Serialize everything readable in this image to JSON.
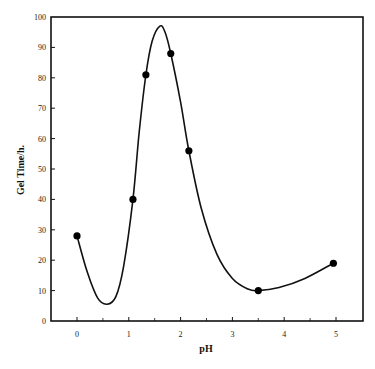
{
  "chart_data": {
    "type": "line",
    "title": "",
    "xlabel": "pH",
    "ylabel": "Gel Time/h.",
    "xlim": [
      -0.5,
      5.6
    ],
    "ylim": [
      0,
      100
    ],
    "x_ticks": [
      0,
      1,
      2,
      3,
      4,
      5
    ],
    "x_tick_labels": [
      "0",
      "1",
      "2",
      "3",
      "4",
      "5"
    ],
    "y_ticks": [
      0,
      10,
      20,
      30,
      40,
      50,
      60,
      70,
      80,
      90,
      100
    ],
    "y_tick_labels": [
      "0",
      "10",
      "20",
      "30",
      "40",
      "50",
      "60",
      "70",
      "80",
      "90",
      "100"
    ],
    "grid": false,
    "legend": null,
    "series": [
      {
        "name": "Gel Time",
        "marker": "filled-circle",
        "points": [
          {
            "x": 0.0,
            "y": 28
          },
          {
            "x": 1.08,
            "y": 40
          },
          {
            "x": 1.33,
            "y": 81
          },
          {
            "x": 1.81,
            "y": 88
          },
          {
            "x": 2.16,
            "y": 56
          },
          {
            "x": 3.5,
            "y": 10
          },
          {
            "x": 4.95,
            "y": 19
          }
        ]
      }
    ],
    "fitted_curve": [
      {
        "x": 0.0,
        "y": 28
      },
      {
        "x": 0.2,
        "y": 16
      },
      {
        "x": 0.4,
        "y": 7.5
      },
      {
        "x": 0.58,
        "y": 5.5
      },
      {
        "x": 0.75,
        "y": 8
      },
      {
        "x": 0.9,
        "y": 18
      },
      {
        "x": 1.08,
        "y": 40
      },
      {
        "x": 1.2,
        "y": 62
      },
      {
        "x": 1.33,
        "y": 81
      },
      {
        "x": 1.45,
        "y": 92
      },
      {
        "x": 1.6,
        "y": 97
      },
      {
        "x": 1.7,
        "y": 95
      },
      {
        "x": 1.81,
        "y": 88
      },
      {
        "x": 2.0,
        "y": 72
      },
      {
        "x": 2.16,
        "y": 56
      },
      {
        "x": 2.4,
        "y": 37
      },
      {
        "x": 2.7,
        "y": 22
      },
      {
        "x": 3.0,
        "y": 14
      },
      {
        "x": 3.3,
        "y": 10.5
      },
      {
        "x": 3.5,
        "y": 10
      },
      {
        "x": 3.9,
        "y": 11
      },
      {
        "x": 4.4,
        "y": 14
      },
      {
        "x": 4.95,
        "y": 19
      }
    ]
  }
}
